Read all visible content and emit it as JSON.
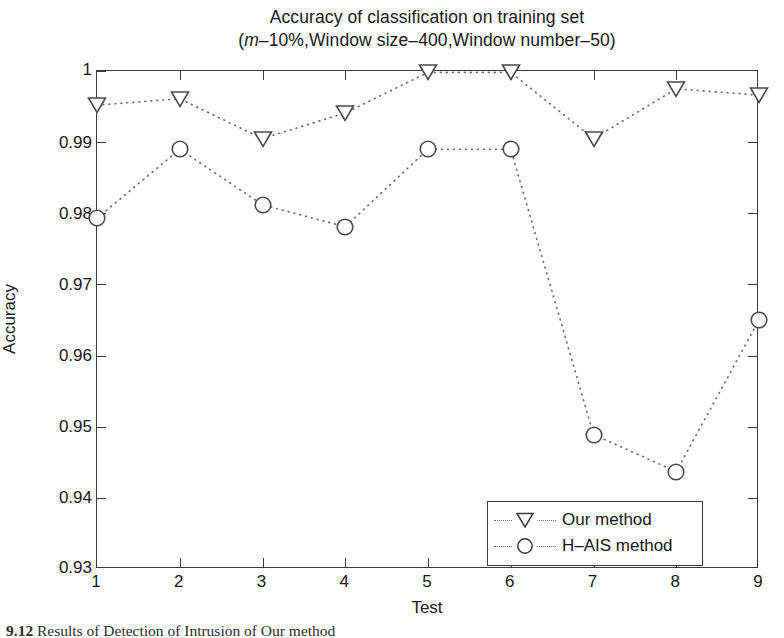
{
  "figure": {
    "title_line1": "Accuracy of classification on training set",
    "title_line2_prefix": "(",
    "title_line2_italic": "m",
    "title_line2_rest": "–10%,Window size–400,Window number–50)",
    "caption_number": "9.12",
    "caption_text": "Results of Detection of Intrusion of Our method"
  },
  "chart_data": {
    "type": "line",
    "title": "Accuracy of classification on training set",
    "subtitle": "(m–10%,Window size–400,Window number–50)",
    "xlabel": "Test",
    "ylabel": "Accuracy",
    "x": [
      1,
      2,
      3,
      4,
      5,
      6,
      7,
      8,
      9
    ],
    "xlim": [
      1,
      9
    ],
    "ylim": [
      0.93,
      1.0
    ],
    "ytick_labels": [
      "0.93",
      "0.94",
      "0.95",
      "0.96",
      "0.97",
      "0.98",
      "0.99",
      "1"
    ],
    "ytick_values": [
      0.93,
      0.94,
      0.95,
      0.96,
      0.97,
      0.98,
      0.99,
      1.0
    ],
    "xtick_labels": [
      "1",
      "2",
      "3",
      "4",
      "5",
      "6",
      "7",
      "8",
      "9"
    ],
    "grid": false,
    "legend_position": "lower right",
    "linestyle": "dotted",
    "series": [
      {
        "name": "Our method",
        "marker": "triangle-down",
        "values": [
          0.9952,
          0.9961,
          0.9905,
          0.9941,
          0.9998,
          0.9998,
          0.9905,
          0.9975,
          0.9966
        ]
      },
      {
        "name": "H–AIS method",
        "marker": "circle",
        "values": [
          0.9793,
          0.989,
          0.9812,
          0.9781,
          0.989,
          0.989,
          0.9489,
          0.9437,
          0.965
        ]
      }
    ]
  },
  "legend": {
    "items": [
      {
        "label": "Our method",
        "marker": "triangle-down-icon"
      },
      {
        "label": "H–AIS method",
        "marker": "circle-icon"
      }
    ]
  }
}
